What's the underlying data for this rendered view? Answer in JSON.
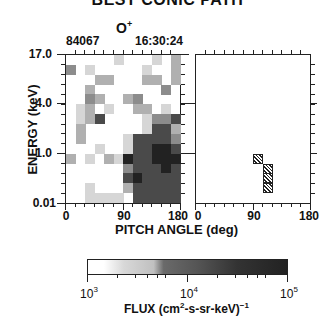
{
  "header": {
    "title": "BEST CONIC PATH",
    "species": "O",
    "species_charge": "+",
    "date_code": "84067",
    "time": "16:30:24"
  },
  "axes": {
    "ylabel": "ENERGY (keV)",
    "yticks": [
      "17.0",
      "4.0",
      "1.0",
      "0.01"
    ],
    "xlabel": "PITCH ANGLE (deg)",
    "xticks": [
      "0",
      "90",
      "180"
    ]
  },
  "colorbar": {
    "ticks": [
      "10",
      "10",
      "10"
    ],
    "tick_exponents": [
      "3",
      "4",
      "5"
    ],
    "label_prefix": "FLUX  (cm",
    "label_exp1": "2",
    "label_mid": "-s-sr-keV)",
    "label_exp2": "−1"
  },
  "chart_data": [
    {
      "type": "heatmap",
      "title": "O+ flux, 84067 16:30:24 (measured)",
      "xlabel": "PITCH ANGLE (deg)",
      "ylabel": "ENERGY (keV)",
      "xlim": [
        0,
        180
      ],
      "y_tick_labels": [
        "17.0",
        "4.0",
        "1.0",
        "0.01"
      ],
      "n_cols": 12,
      "n_rows": 15,
      "value_scale": "intensity level 0 (none) .. 5 (~1e5 flux), log color scale 1e3..1e5",
      "rows_top_to_bottom": [
        [
          0,
          0,
          0,
          0,
          0,
          1,
          0,
          0,
          0,
          1,
          0,
          2
        ],
        [
          3,
          0,
          1,
          0,
          0,
          0,
          0,
          0,
          1,
          0,
          0,
          2
        ],
        [
          0,
          0,
          0,
          2,
          2,
          0,
          0,
          0,
          2,
          2,
          0,
          2
        ],
        [
          0,
          0,
          2,
          0,
          0,
          0,
          0,
          0,
          0,
          0,
          3,
          0
        ],
        [
          0,
          0,
          3,
          2,
          0,
          0,
          2,
          3,
          0,
          0,
          0,
          0
        ],
        [
          0,
          1,
          2,
          0,
          1,
          0,
          0,
          2,
          2,
          0,
          1,
          0
        ],
        [
          0,
          1,
          2,
          4,
          0,
          0,
          0,
          0,
          1,
          3,
          3,
          4
        ],
        [
          0,
          2,
          0,
          0,
          0,
          0,
          0,
          0,
          1,
          4,
          4,
          2
        ],
        [
          0,
          2,
          0,
          0,
          0,
          0,
          1,
          4,
          4,
          4,
          4,
          3
        ],
        [
          0,
          0,
          0,
          1,
          0,
          0,
          1,
          4,
          4,
          5,
          5,
          4
        ],
        [
          2,
          0,
          1,
          0,
          2,
          1,
          5,
          4,
          4,
          5,
          5,
          5
        ],
        [
          0,
          0,
          0,
          0,
          0,
          0,
          3,
          4,
          4,
          4,
          5,
          4
        ],
        [
          0,
          0,
          0,
          0,
          0,
          0,
          4,
          5,
          4,
          4,
          4,
          4
        ],
        [
          0,
          0,
          1,
          0,
          0,
          0,
          2,
          4,
          4,
          4,
          4,
          4
        ],
        [
          0,
          0,
          1,
          1,
          1,
          1,
          0,
          4,
          4,
          4,
          4,
          4
        ]
      ]
    },
    {
      "type": "heatmap",
      "title": "Best conic path (hatched bins)",
      "xlabel": "PITCH ANGLE (deg)",
      "xlim": [
        0,
        180
      ],
      "n_cols": 12,
      "n_rows": 15,
      "hatched_cells": [
        {
          "row": 10,
          "col": 6
        },
        {
          "row": 11,
          "col": 7
        },
        {
          "row": 12,
          "col": 7
        },
        {
          "row": 13,
          "col": 7
        }
      ]
    },
    {
      "type": "colorbar",
      "label": "FLUX (cm^2-s-sr-keV)^-1",
      "range": [
        1000,
        100000
      ],
      "scale": "log",
      "ticks": [
        1000,
        10000,
        100000
      ]
    }
  ]
}
